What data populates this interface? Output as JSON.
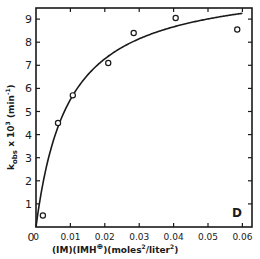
{
  "chart_data": {
    "type": "scatter",
    "title": "",
    "xlabel": "(IM)(IMH⊕)(moles²/liter²)",
    "xlabel_parts": {
      "main": "(IM)(IMH",
      "sup": "⊕",
      "rest": ")(moles",
      "sup2": "2",
      "rest2": "/liter",
      "sup3": "2",
      "end": ")"
    },
    "ylabel": "k_obs x 10^3 (min^-1)",
    "ylabel_parts": {
      "k": "k",
      "sub": "obs",
      "mid": " x 10",
      "sup": "3",
      "unit": " (min",
      "unitsup": "-1",
      "end": ")"
    },
    "panel_label": "D",
    "xlim": [
      0,
      0.06
    ],
    "ylim": [
      0,
      9.5
    ],
    "xticks": [
      0,
      0.01,
      0.02,
      0.03,
      0.04,
      0.05,
      0.06
    ],
    "xtick_labels": [
      "0",
      "0.01",
      "0.02",
      "0.03",
      "0.04",
      "0.05",
      "0.06"
    ],
    "yticks": [
      0,
      1,
      2,
      3,
      4,
      5,
      6,
      7,
      8,
      9
    ],
    "ytick_labels": [
      "0",
      "1",
      "2",
      "3",
      "4",
      "5",
      "6",
      "7",
      "8",
      "9"
    ],
    "grid": false,
    "legend": null,
    "series": [
      {
        "name": "observed",
        "marker": "open-circle",
        "x": [
          0.002,
          0.0064,
          0.0107,
          0.021,
          0.0284,
          0.0406,
          0.0585
        ],
        "y": [
          0.5,
          4.5,
          5.7,
          7.1,
          8.4,
          9.05,
          8.55
        ]
      },
      {
        "name": "fitted curve",
        "style": "solid-line",
        "model": "y = Vmax*x/(K+x)",
        "params": {
          "Vmax": 10.7,
          "K": 0.0094
        }
      }
    ],
    "colors": {
      "ink": "#1a1a1a",
      "background": "#ffffff"
    }
  }
}
